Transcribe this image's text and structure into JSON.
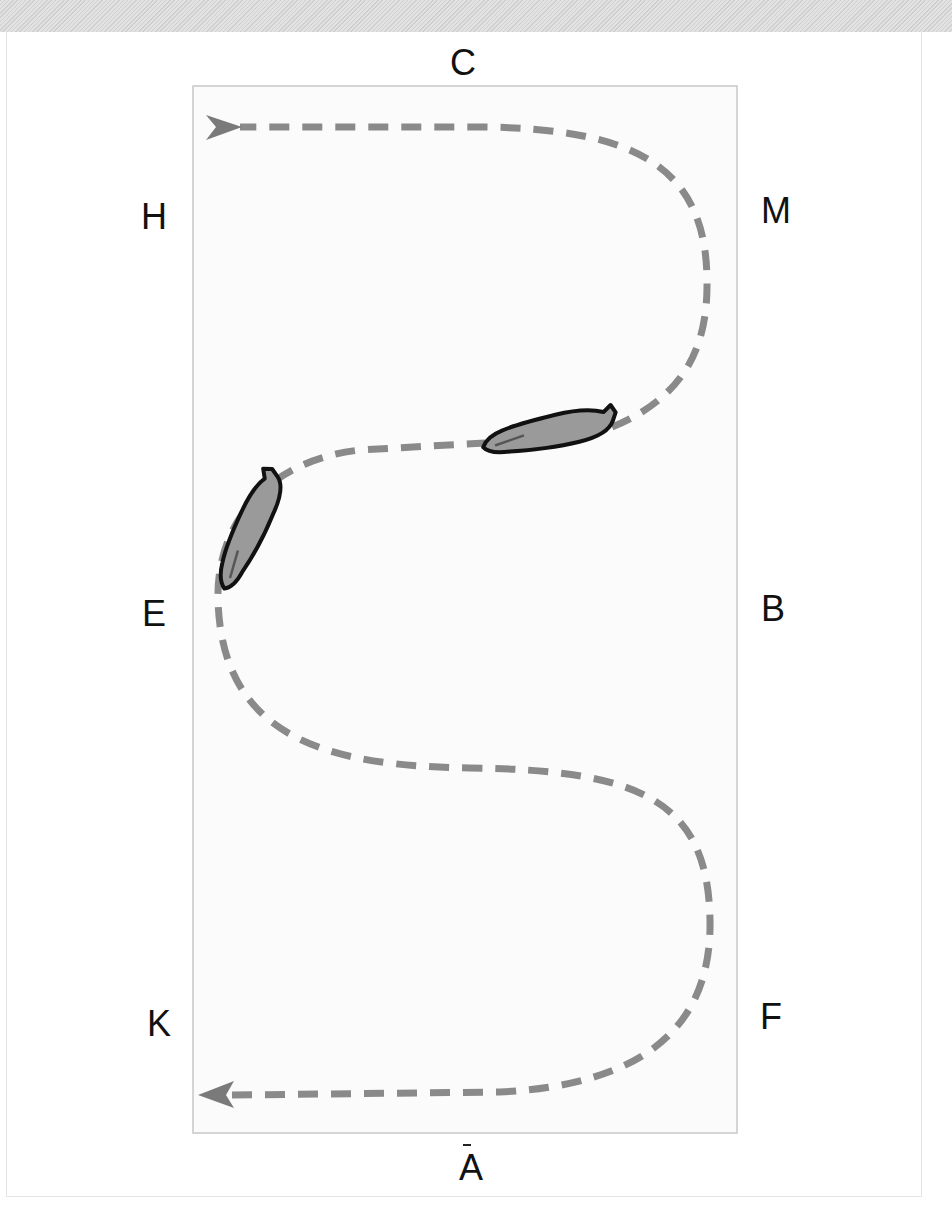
{
  "diagram": {
    "type": "dressage-arena-serpentine",
    "arena": {
      "x": 193,
      "y": 86,
      "width": 544,
      "height": 1047,
      "border_color": "#c8c8c8",
      "fill": "#fbfbfb"
    },
    "markers": [
      {
        "letter": "C",
        "x": 463,
        "y": 63
      },
      {
        "letter": "H",
        "x": 154,
        "y": 217
      },
      {
        "letter": "M",
        "x": 776,
        "y": 211
      },
      {
        "letter": "E",
        "x": 154,
        "y": 614
      },
      {
        "letter": "B",
        "x": 773,
        "y": 609
      },
      {
        "letter": "K",
        "x": 159,
        "y": 1024
      },
      {
        "letter": "F",
        "x": 771,
        "y": 1017
      },
      {
        "letter": "A",
        "x": 471,
        "y": 1168
      }
    ],
    "path": {
      "style": "dashed",
      "color": "#8a8a8a",
      "start_arrow": "left-pointing at bottom (A end)",
      "end_arrow": "right-pointing at top (C end)"
    },
    "horses": [
      {
        "label": "horse-at-centerline",
        "x": 548,
        "y": 434,
        "angle": -8
      },
      {
        "label": "horse-at-E",
        "x": 250,
        "y": 532,
        "angle": -62
      }
    ],
    "colors": {
      "band": "#d9d9d9",
      "path": "#8a8a8a",
      "horse_fill": "#9a9a9a",
      "horse_outline": "#111111",
      "text": "#111111"
    }
  }
}
